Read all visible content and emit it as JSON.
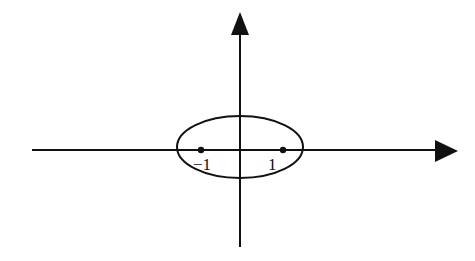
{
  "diagram": {
    "type": "ellipse-on-axes",
    "stroke_color": "#111111",
    "background": "#ffffff",
    "axes": {
      "x_axis": {
        "x1": 32,
        "x2": 457,
        "y": 150,
        "arrow": "right"
      },
      "y_axis": {
        "x": 240,
        "y1": 13,
        "y2": 247,
        "arrow": "up"
      }
    },
    "ellipse": {
      "cx": 240,
      "cy": 147,
      "rx": 63,
      "ry": 31
    },
    "points": [
      {
        "label": "-1",
        "display": "−1",
        "x": 201,
        "y": 150
      },
      {
        "label": "1",
        "display": "1",
        "x": 283,
        "y": 150
      }
    ]
  }
}
